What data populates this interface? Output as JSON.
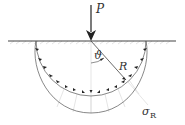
{
  "diagram": {
    "labels": {
      "load": "P",
      "angle": "ϑ",
      "radius": "R",
      "stress": "σ",
      "stress_subscript": "R"
    },
    "colors": {
      "lines": "#333333",
      "surface": "#444444",
      "hatch": "#c8c8c8",
      "guide_lines": "#cccccc"
    },
    "geometry": {
      "surface_y": 41,
      "load_x": 91,
      "circle_radius": 55,
      "outer_depth_y": 113
    }
  }
}
